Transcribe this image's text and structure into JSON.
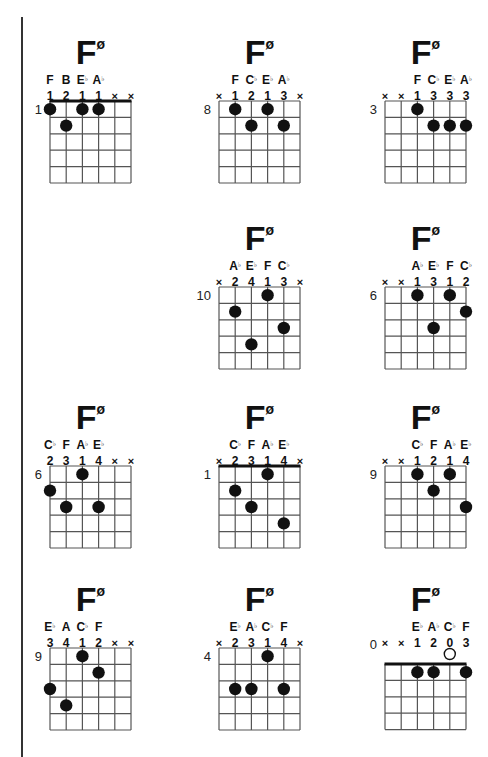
{
  "page": {
    "chord_symbol": "F",
    "chord_quality": "ø"
  },
  "chords": [
    {
      "root": "F",
      "quality": "ø",
      "start_fret": "1",
      "nut": true,
      "frets_shown": 5,
      "notes": [
        "F",
        "B",
        "E♭",
        "A♭",
        "",
        ""
      ],
      "fingers": [
        "1",
        "2",
        "1",
        "1",
        "×",
        "×"
      ],
      "dots": [
        [
          0,
          1
        ],
        [
          2,
          1
        ],
        [
          3,
          1
        ],
        [
          1,
          2
        ]
      ],
      "open": [],
      "barre": false
    },
    {
      "root": "F",
      "quality": "ø",
      "start_fret": "8",
      "nut": false,
      "frets_shown": 5,
      "notes": [
        "",
        "F",
        "C♭",
        "E♭",
        "A♭",
        ""
      ],
      "fingers": [
        "×",
        "1",
        "2",
        "1",
        "3",
        "×"
      ],
      "dots": [
        [
          1,
          1
        ],
        [
          3,
          1
        ],
        [
          2,
          2
        ],
        [
          4,
          2
        ]
      ],
      "open": []
    },
    {
      "root": "F",
      "quality": "ø",
      "start_fret": "3",
      "nut": false,
      "frets_shown": 5,
      "notes": [
        "",
        "",
        "F",
        "C♭",
        "E♭",
        "A♭"
      ],
      "fingers": [
        "×",
        "×",
        "1",
        "3",
        "3",
        "3"
      ],
      "dots": [
        [
          2,
          1
        ],
        [
          3,
          2
        ],
        [
          4,
          2
        ],
        [
          5,
          2
        ]
      ],
      "open": []
    },
    {
      "root": "F",
      "quality": "ø",
      "start_fret": "10",
      "nut": false,
      "frets_shown": 5,
      "notes": [
        "",
        "A♭",
        "E♭",
        "F",
        "C♭",
        ""
      ],
      "fingers": [
        "×",
        "2",
        "4",
        "1",
        "3",
        "×"
      ],
      "dots": [
        [
          3,
          1
        ],
        [
          1,
          2
        ],
        [
          4,
          3
        ],
        [
          2,
          4
        ]
      ],
      "open": []
    },
    {
      "root": "F",
      "quality": "ø",
      "start_fret": "6",
      "nut": false,
      "frets_shown": 5,
      "notes": [
        "",
        "",
        "A♭",
        "E♭",
        "F",
        "C♭"
      ],
      "fingers": [
        "×",
        "×",
        "1",
        "3",
        "1",
        "2"
      ],
      "dots": [
        [
          2,
          1
        ],
        [
          4,
          1
        ],
        [
          5,
          2
        ],
        [
          3,
          3
        ]
      ],
      "open": []
    },
    {
      "root": "F",
      "quality": "ø",
      "start_fret": "6",
      "nut": false,
      "frets_shown": 5,
      "notes": [
        "C♭",
        "F",
        "A♭",
        "E♭",
        "",
        ""
      ],
      "fingers": [
        "2",
        "3",
        "1",
        "4",
        "×",
        "×"
      ],
      "dots": [
        [
          2,
          1
        ],
        [
          0,
          2
        ],
        [
          1,
          3
        ],
        [
          3,
          3
        ]
      ],
      "open": []
    },
    {
      "root": "F",
      "quality": "ø",
      "start_fret": "1",
      "nut": true,
      "frets_shown": 5,
      "notes": [
        "",
        "C♭",
        "F",
        "A♭",
        "E♭",
        ""
      ],
      "fingers": [
        "×",
        "2",
        "3",
        "1",
        "4",
        "×"
      ],
      "dots": [
        [
          3,
          1
        ],
        [
          1,
          2
        ],
        [
          2,
          3
        ],
        [
          4,
          4
        ]
      ],
      "open": []
    },
    {
      "root": "F",
      "quality": "ø",
      "start_fret": "9",
      "nut": false,
      "frets_shown": 5,
      "notes": [
        "",
        "",
        "C♭",
        "F",
        "A♭",
        "E♭"
      ],
      "fingers": [
        "×",
        "×",
        "1",
        "2",
        "1",
        "4"
      ],
      "dots": [
        [
          2,
          1
        ],
        [
          4,
          1
        ],
        [
          3,
          2
        ],
        [
          5,
          3
        ]
      ],
      "open": []
    },
    {
      "root": "F",
      "quality": "ø",
      "start_fret": "9",
      "nut": false,
      "frets_shown": 5,
      "notes": [
        "E♭",
        "A",
        "C♭",
        "F",
        "",
        ""
      ],
      "fingers": [
        "3",
        "4",
        "1",
        "2",
        "×",
        "×"
      ],
      "dots": [
        [
          2,
          1
        ],
        [
          3,
          2
        ],
        [
          0,
          3
        ],
        [
          1,
          4
        ]
      ],
      "open": []
    },
    {
      "root": "F",
      "quality": "ø",
      "start_fret": "4",
      "nut": false,
      "frets_shown": 5,
      "notes": [
        "",
        "E♭",
        "A♭",
        "C♭",
        "F",
        ""
      ],
      "fingers": [
        "×",
        "2",
        "3",
        "1",
        "4",
        "×"
      ],
      "dots": [
        [
          3,
          1
        ],
        [
          1,
          3
        ],
        [
          2,
          3
        ],
        [
          4,
          3
        ]
      ],
      "open": []
    },
    {
      "root": "F",
      "quality": "ø",
      "start_fret": "0",
      "nut": true,
      "frets_shown": 4,
      "notes": [
        "",
        "",
        "E♭",
        "A♭",
        "C♭",
        "F"
      ],
      "fingers": [
        "×",
        "×",
        "1",
        "2",
        "0",
        "3"
      ],
      "dots": [
        [
          2,
          1
        ],
        [
          3,
          1
        ],
        [
          5,
          1
        ]
      ],
      "open": [
        4
      ]
    }
  ]
}
